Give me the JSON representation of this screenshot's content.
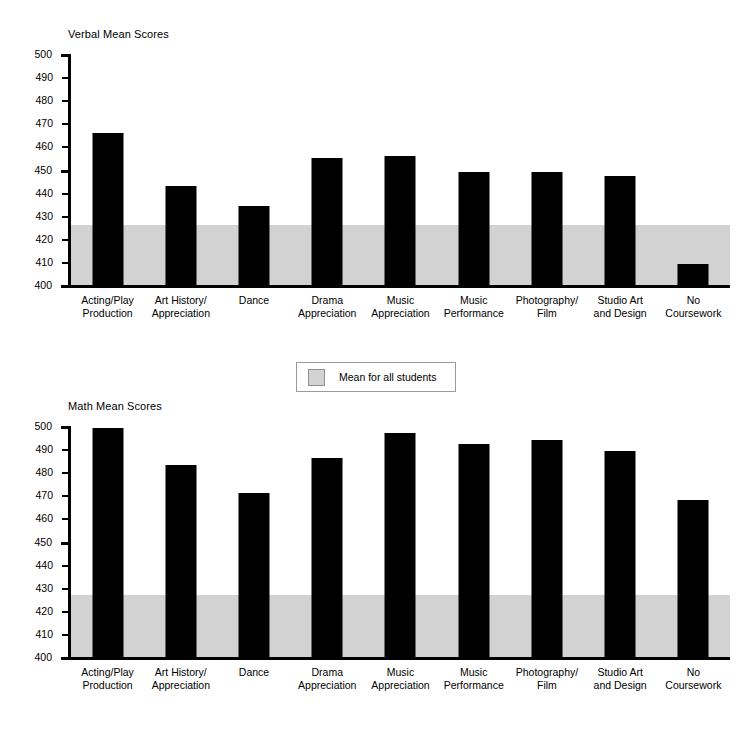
{
  "legend": {
    "label": "Mean for all students",
    "swatch_color": "#d2d2d2",
    "swatch_name": "mean-band-swatch"
  },
  "axis": {
    "ticks": [
      500,
      490,
      480,
      470,
      460,
      450,
      440,
      430,
      420,
      410,
      400
    ],
    "min": 400,
    "max": 500
  },
  "categories": [
    "Acting/Play\nProduction",
    "Art History/\nAppreciation",
    "Dance",
    "Drama\nAppreciation",
    "Music\nAppreciation",
    "Music\nPerformance",
    "Photography/\nFilm",
    "Studio Art\nand Design",
    "No\nCoursework"
  ],
  "chart_data": [
    {
      "type": "bar",
      "title": "Verbal Mean Scores",
      "xlabel": "",
      "ylabel": "",
      "ylim": [
        400,
        500
      ],
      "ytick_step": 10,
      "grid": false,
      "bar_color": "#000000",
      "categories": [
        "Acting/Play Production",
        "Art History/Appreciation",
        "Dance",
        "Drama Appreciation",
        "Music Appreciation",
        "Music Performance",
        "Photography/Film",
        "Studio Art and Design",
        "No Coursework"
      ],
      "values": [
        466,
        443,
        434,
        455,
        456,
        449,
        449,
        447,
        409
      ],
      "annotations": [
        {
          "name": "mean-for-all-students-band",
          "type": "hband",
          "from": 400,
          "to": 426,
          "color": "#d2d2d2",
          "label": "Mean for all students"
        }
      ]
    },
    {
      "type": "bar",
      "title": "Math Mean Scores",
      "xlabel": "",
      "ylabel": "",
      "ylim": [
        400,
        500
      ],
      "ytick_step": 10,
      "grid": false,
      "bar_color": "#000000",
      "categories": [
        "Acting/Play Production",
        "Art History/Appreciation",
        "Dance",
        "Drama Appreciation",
        "Music Appreciation",
        "Music Performance",
        "Photography/Film",
        "Studio Art and Design",
        "No Coursework"
      ],
      "values": [
        499,
        483,
        471,
        486,
        497,
        492,
        494,
        489,
        468
      ],
      "annotations": [
        {
          "name": "mean-for-all-students-band",
          "type": "hband",
          "from": 400,
          "to": 427,
          "color": "#d2d2d2",
          "label": "Mean for all students"
        }
      ]
    }
  ]
}
